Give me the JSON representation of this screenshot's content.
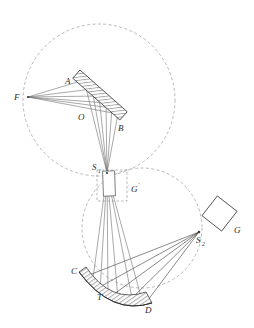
{
  "figure": {
    "background_color": "#ffffff",
    "width": 254,
    "height": 328
  },
  "colors": {
    "ray": "#6e6e6e",
    "ray_dark": "#4a4a4a",
    "dashed_circle": "#9a9a9a",
    "outline": "#3a3a3a",
    "hatch": "#555555",
    "label": "#2b2b2b"
  },
  "labels": {
    "F": "F",
    "A": "A",
    "B": "B",
    "O": "O",
    "S1": "S",
    "S1_sub": "1",
    "G_prime": "G",
    "G_prime_sup": "'",
    "C": "C",
    "T": "T",
    "D": "D",
    "S2": "S",
    "S2_sub": "2",
    "G": "G"
  },
  "elements": {
    "top_circle": {
      "name": "rowland-circle-upper",
      "cx": 99,
      "cy": 100,
      "r": 76,
      "style": "dashed"
    },
    "bottom_circle": {
      "name": "rowland-circle-lower",
      "cx": 142,
      "cy": 228,
      "r": 60,
      "style": "dashed"
    },
    "grating_AB": {
      "name": "diffraction-grating",
      "from": "A",
      "to": "B",
      "style": "hatched-bar"
    },
    "slit_S1": {
      "name": "entrance-slit",
      "x": 107,
      "y": 173
    },
    "slit_G_prime": {
      "name": "intermediate-slit-box",
      "x": 104,
      "y": 176
    },
    "dashed_box_G_prime": {
      "name": "virtual-grating-region",
      "x": 97,
      "y": 170,
      "w": 30,
      "h": 31
    },
    "mirror_CD": {
      "name": "concave-mirror",
      "from": "C",
      "to": "D",
      "style": "hatched-arc"
    },
    "point_S2": {
      "name": "exit-slit",
      "x": 199,
      "y": 232
    },
    "square_G": {
      "name": "detector-grating",
      "cx": 220,
      "cy": 214,
      "size": 24,
      "rotation_deg": 38
    },
    "point_F": {
      "name": "focus-point",
      "x": 28,
      "y": 97
    }
  },
  "ray_bundles": {
    "upper_bundle_label": "F to grating AB",
    "mid_bundle_label": "grating AB to S1 and through G'",
    "lower_bundle_label": "S1 through G' to mirror CD",
    "exit_bundle_label": "mirror CD to S2 and G"
  }
}
